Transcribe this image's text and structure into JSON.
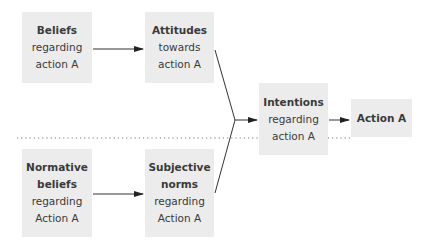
{
  "diagram": {
    "type": "flowchart",
    "boxes": {
      "beliefs": {
        "lines": [
          "Beliefs",
          "regarding",
          "action A"
        ]
      },
      "attitudes": {
        "lines": [
          "Attitudes",
          "towards",
          "action A"
        ]
      },
      "normative": {
        "lines": [
          "Normative",
          "beliefs",
          "regarding",
          "Action A"
        ]
      },
      "subjective": {
        "lines": [
          "Subjective",
          "norms",
          "regarding",
          "Action A"
        ]
      },
      "intentions": {
        "lines": [
          "Intentions",
          "regarding",
          "action A"
        ]
      },
      "action": {
        "lines": [
          "Action A"
        ]
      }
    },
    "edges": [
      {
        "from": "beliefs",
        "to": "attitudes"
      },
      {
        "from": "normative",
        "to": "subjective"
      },
      {
        "from": "attitudes",
        "to": "intentions"
      },
      {
        "from": "subjective",
        "to": "intentions"
      },
      {
        "from": "intentions",
        "to": "action"
      }
    ],
    "colors": {
      "box_fill": "#ececec",
      "line": "#333333",
      "text": "#3a3a3a"
    }
  }
}
